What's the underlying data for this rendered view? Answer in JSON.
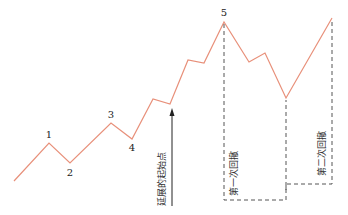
{
  "diagram": {
    "type": "elliott-wave-extension",
    "line_color": "#e8907a",
    "dash_color": "#555555",
    "points": [
      [
        14,
        181
      ],
      [
        49,
        143
      ],
      [
        70,
        163
      ],
      [
        111,
        123
      ],
      [
        132,
        139
      ],
      [
        153,
        99
      ],
      [
        170,
        104
      ],
      [
        188,
        60
      ],
      [
        204,
        63
      ],
      [
        224,
        22
      ],
      [
        249,
        62
      ],
      [
        265,
        53
      ],
      [
        286,
        98
      ],
      [
        332,
        18
      ]
    ],
    "wave_labels": [
      {
        "text": "1",
        "x": 49,
        "y": 138
      },
      {
        "text": "2",
        "x": 70,
        "y": 176
      },
      {
        "text": "3",
        "x": 111,
        "y": 118
      },
      {
        "text": "4",
        "x": 132,
        "y": 151
      },
      {
        "text": "5",
        "x": 224,
        "y": 16
      }
    ],
    "arrow": {
      "label": "延展的起始点",
      "x": 172,
      "y_start": 206,
      "y_end": 110
    },
    "retracements": [
      {
        "label": "第一次回撤"
      },
      {
        "label": "第二次回撤"
      }
    ]
  }
}
